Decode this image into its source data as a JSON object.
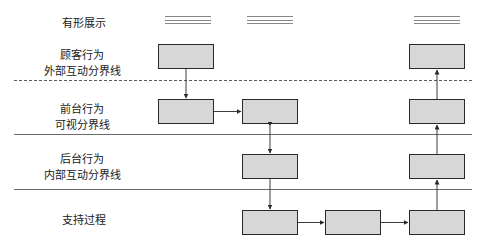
{
  "diagram": {
    "type": "service blueprint",
    "lanes": [
      {
        "id": "physical-evidence",
        "label_lines": [
          "有形展示"
        ]
      },
      {
        "id": "customer-actions",
        "label_lines": [
          "顾客行为",
          "外部互动分界线"
        ]
      },
      {
        "id": "onstage-actions",
        "label_lines": [
          "前台行为",
          "可视分界线"
        ]
      },
      {
        "id": "backstage-actions",
        "label_lines": [
          "后台行为",
          "内部互动分界线"
        ]
      },
      {
        "id": "support-processes",
        "label_lines": [
          "支持过程"
        ]
      }
    ],
    "separators": [
      {
        "name": "line-of-interaction",
        "style": "dashed"
      },
      {
        "name": "line-of-visibility",
        "style": "solid"
      },
      {
        "name": "line-of-internal-interaction",
        "style": "solid"
      }
    ],
    "colors": {
      "box_fill": "#d7d7d7",
      "box_border": "#2a2a2a",
      "line": "#6a6a6a",
      "text": "#1a1a1a"
    }
  }
}
